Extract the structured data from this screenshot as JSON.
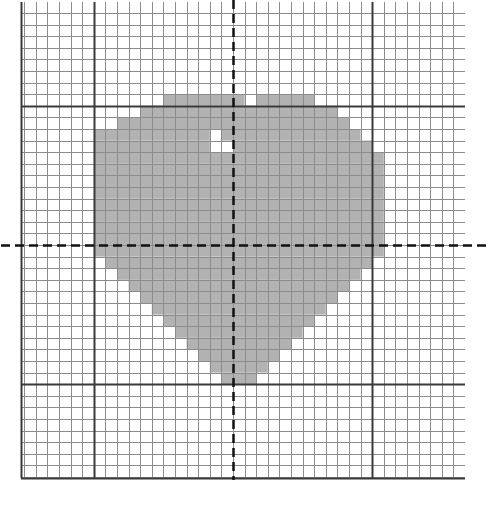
{
  "figure": {
    "title": "",
    "background_color": "#ffffff",
    "width": 489,
    "height": 521
  },
  "grid": {
    "origin_x": 233,
    "origin_y": 245,
    "cell": 11.6,
    "left": 21,
    "top": 2,
    "right": 465,
    "bottom": 478,
    "minor_color": "#8c8c8c",
    "minor_width": 1,
    "major_color": "#3a3a3a",
    "major_width": 2,
    "major_every": 12,
    "major_x_positions": [
      94,
      233,
      372
    ],
    "major_y_positions": [
      100,
      245,
      390
    ],
    "axis_color": "#111111",
    "axis_width": 2.5,
    "axis_dash": "9,5"
  },
  "chart_data": {
    "type": "heatmap",
    "subtitle": "",
    "xlabel": "",
    "ylabel": "",
    "xlim": [
      -18,
      20
    ],
    "ylim": [
      -20,
      21
    ],
    "grid": true,
    "legend": "none",
    "cell_size": 11.6,
    "fill_color": "#b2b2b2",
    "fill_stroke": "#8c8c8c",
    "shape_name": "heart",
    "categories": [
      "empty",
      "filled"
    ],
    "values": [
      0,
      1
    ],
    "rows": [
      {
        "y": 12,
        "runs": [
          [
            -6,
            1
          ],
          [
            2,
            7
          ]
        ]
      },
      {
        "y": 11,
        "runs": [
          [
            -8,
            1
          ],
          [
            0,
            9
          ]
        ]
      },
      {
        "y": 10,
        "runs": [
          [
            -10,
            -1
          ],
          [
            -1,
            10
          ]
        ]
      },
      {
        "y": 9,
        "runs": [
          [
            -12,
            -2
          ],
          [
            -1,
            11
          ]
        ]
      },
      {
        "y": 8,
        "runs": [
          [
            -12,
            -2
          ],
          [
            0,
            12
          ]
        ]
      },
      {
        "y": 7,
        "runs": [
          [
            -12,
            13
          ]
        ]
      },
      {
        "y": 6,
        "runs": [
          [
            -12,
            13
          ]
        ]
      },
      {
        "y": 5,
        "runs": [
          [
            -12,
            13
          ]
        ]
      },
      {
        "y": 4,
        "runs": [
          [
            -12,
            13
          ]
        ]
      },
      {
        "y": 3,
        "runs": [
          [
            -12,
            13
          ]
        ]
      },
      {
        "y": 2,
        "runs": [
          [
            -12,
            13
          ]
        ]
      },
      {
        "y": 1,
        "runs": [
          [
            -12,
            13
          ]
        ]
      },
      {
        "y": 0,
        "runs": [
          [
            -12,
            13
          ]
        ]
      },
      {
        "y": -1,
        "runs": [
          [
            -12,
            13
          ]
        ]
      },
      {
        "y": -2,
        "runs": [
          [
            -11,
            12
          ]
        ]
      },
      {
        "y": -3,
        "runs": [
          [
            -10,
            11
          ]
        ]
      },
      {
        "y": -4,
        "runs": [
          [
            -9,
            10
          ]
        ]
      },
      {
        "y": -5,
        "runs": [
          [
            -8,
            9
          ]
        ]
      },
      {
        "y": -6,
        "runs": [
          [
            -7,
            8
          ]
        ]
      },
      {
        "y": -7,
        "runs": [
          [
            -6,
            7
          ]
        ]
      },
      {
        "y": -8,
        "runs": [
          [
            -5,
            6
          ]
        ]
      },
      {
        "y": -9,
        "runs": [
          [
            -4,
            5
          ]
        ]
      },
      {
        "y": -10,
        "runs": [
          [
            -3,
            4
          ]
        ]
      },
      {
        "y": -11,
        "runs": [
          [
            -2,
            3
          ]
        ]
      },
      {
        "y": -12,
        "runs": [
          [
            -1,
            2
          ]
        ]
      }
    ]
  }
}
